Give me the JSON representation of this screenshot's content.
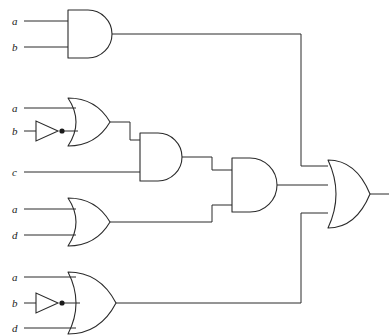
{
  "diagram": {
    "background_color": "#ffffff",
    "line_color": "#2b2b2b",
    "label_color": "#1a1a1a",
    "width": 389,
    "height": 336,
    "output_signal": ""
  },
  "labels": {
    "g1_in1": "a",
    "g1_in2": "b",
    "g2_in1": "a",
    "g2_in2": "b",
    "g3_in1": "c",
    "g4_in1": "a",
    "g4_in2": "d",
    "g5_in1": "a",
    "g5_in2": "b",
    "g5_in3": "d"
  },
  "gates": [
    {
      "id": "and-top",
      "type": "AND",
      "inputs": [
        "a",
        "b"
      ],
      "x": 68,
      "y": 34
    },
    {
      "id": "or-a-notb",
      "type": "OR",
      "inputs": [
        "a",
        "not b"
      ],
      "x": 68,
      "y": 122
    },
    {
      "id": "and-mid",
      "type": "AND",
      "inputs": [
        "or-a-notb",
        "c"
      ],
      "x": 140,
      "y": 157
    },
    {
      "id": "or-a-d",
      "type": "OR",
      "inputs": [
        "a",
        "d"
      ],
      "x": 68,
      "y": 222
    },
    {
      "id": "and-right",
      "type": "AND",
      "inputs": [
        "and-mid",
        "or-a-d"
      ],
      "x": 232,
      "y": 185
    },
    {
      "id": "or-a-notb-d",
      "type": "OR",
      "inputs": [
        "a",
        "not b",
        "d"
      ],
      "x": 68,
      "y": 303
    },
    {
      "id": "or-output",
      "type": "OR",
      "inputs": [
        "and-top",
        "and-right",
        "or-a-notb-d"
      ],
      "x": 328,
      "y": 194
    }
  ],
  "inverters": [
    {
      "id": "inv-b-upper",
      "input": "b",
      "x": 44,
      "y": 128
    },
    {
      "id": "inv-b-lower",
      "input": "b",
      "x": 44,
      "y": 303
    }
  ]
}
